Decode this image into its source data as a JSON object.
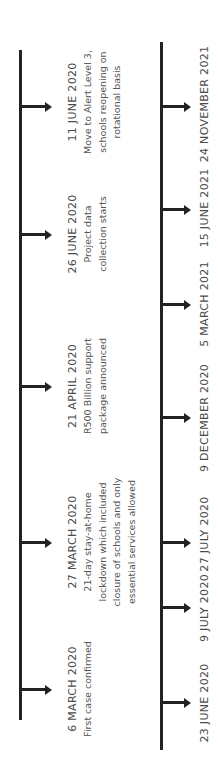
{
  "orientation": "rotated-90-ccw",
  "colors": {
    "line": "#222222",
    "text": "#555555"
  },
  "top_timeline": {
    "events": [
      {
        "date": "6 MARCH 2020",
        "lines": [
          "First case confirmed"
        ]
      },
      {
        "date": "27 MARCH 2020",
        "lines": [
          "21-day stay-at-home",
          "lockdown which included",
          "closure of schools and only",
          "essential services allowed"
        ]
      },
      {
        "date": "21 APRIL 2020",
        "lines": [
          "R500 Billion support",
          "package announced"
        ]
      },
      {
        "date": "26 JUNE 2020",
        "lines": [
          "Project data",
          "collection starts"
        ]
      },
      {
        "date": "11 JUNE 2020",
        "lines": [
          "Move to Alert Level 3,",
          "schools reopening on",
          "rotational basis"
        ]
      }
    ]
  },
  "bottom_timeline": {
    "dates": [
      "23 JUNE 2020",
      "9 JULY 2020",
      "27 JULY 2020",
      "9 DECEMBER 2020",
      "5 MARCH 2021",
      "15 JUNE 2021",
      "24 NOVEMBER 2021"
    ]
  }
}
